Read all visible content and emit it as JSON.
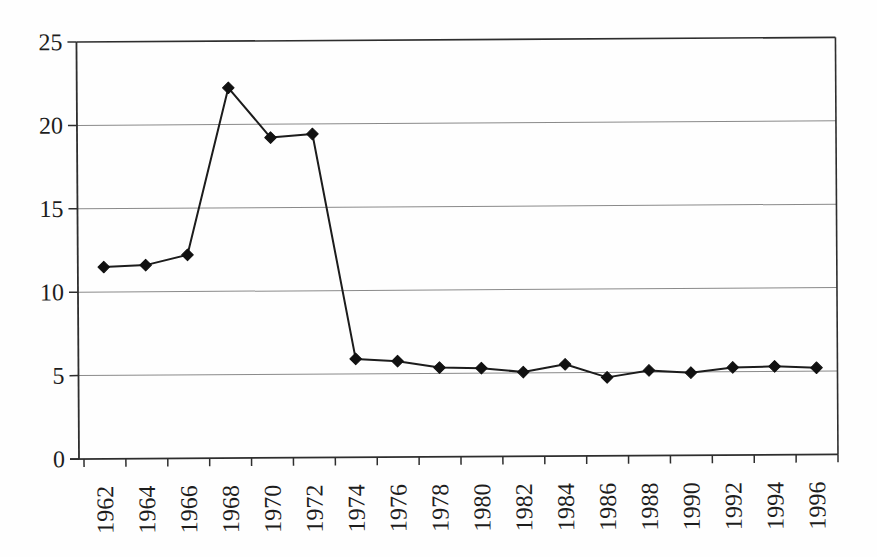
{
  "chart_data": {
    "type": "line",
    "categories": [
      "1962",
      "1964",
      "1966",
      "1968",
      "1970",
      "1972",
      "1974",
      "1976",
      "1978",
      "1980",
      "1982",
      "1984",
      "1986",
      "1988",
      "1990",
      "1992",
      "1994",
      "1996"
    ],
    "values": [
      11.5,
      11.6,
      12.2,
      22.2,
      19.2,
      19.4,
      5.9,
      5.75,
      5.35,
      5.3,
      5.05,
      5.5,
      4.7,
      5.1,
      4.95,
      5.25,
      5.3,
      5.2
    ],
    "title": "",
    "xlabel": "",
    "ylabel": "",
    "ylim": [
      0,
      25
    ],
    "yticks": [
      0,
      5,
      10,
      15,
      20,
      25
    ],
    "grid": true,
    "legend": "none",
    "marker": "diamond",
    "colors": {
      "line": "#1c1c1c",
      "marker": "#111111",
      "gridline": "#8a8a8a",
      "axis": "#2e2e2e",
      "label": "#1d1d1d",
      "background": "#fefefe"
    }
  }
}
